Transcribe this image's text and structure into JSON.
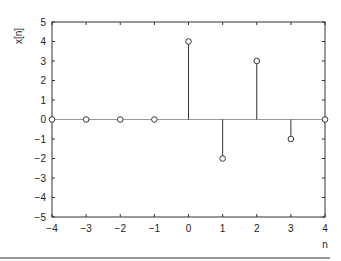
{
  "chart_data": {
    "type": "stem",
    "title": "",
    "xlabel": "n",
    "ylabel": "x[n]",
    "xlim": [
      -4,
      4
    ],
    "ylim": [
      -5,
      5
    ],
    "xticks": [
      -4,
      -3,
      -2,
      -1,
      0,
      1,
      2,
      3,
      4
    ],
    "yticks": [
      -5,
      -4,
      -3,
      -2,
      -1,
      0,
      1,
      2,
      3,
      4,
      5
    ],
    "x": [
      -4,
      -3,
      -2,
      -1,
      0,
      1,
      2,
      3,
      4
    ],
    "values": [
      0,
      0,
      0,
      0,
      4,
      -2,
      3,
      -1,
      0
    ],
    "grid": false,
    "marker": "open-circle"
  },
  "colors": {
    "axis": "#333333",
    "stem": "#333333",
    "baseline": "#999999"
  }
}
